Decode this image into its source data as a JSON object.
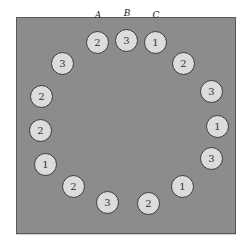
{
  "diagram": {
    "labels": [
      {
        "text": "A",
        "x": 98,
        "y": 19
      },
      {
        "text": "B",
        "x": 127,
        "y": 17
      },
      {
        "text": "C",
        "x": 156,
        "y": 19
      }
    ],
    "tokens": [
      {
        "value": "2",
        "x": 98,
        "y": 43
      },
      {
        "value": "3",
        "x": 127,
        "y": 41
      },
      {
        "value": "1",
        "x": 156,
        "y": 43
      },
      {
        "value": "2",
        "x": 184,
        "y": 64
      },
      {
        "value": "3",
        "x": 212,
        "y": 92
      },
      {
        "value": "1",
        "x": 218,
        "y": 127
      },
      {
        "value": "3",
        "x": 212,
        "y": 159
      },
      {
        "value": "1",
        "x": 183,
        "y": 187
      },
      {
        "value": "2",
        "x": 149,
        "y": 204
      },
      {
        "value": "3",
        "x": 108,
        "y": 203
      },
      {
        "value": "2",
        "x": 74,
        "y": 187
      },
      {
        "value": "1",
        "x": 46,
        "y": 165
      },
      {
        "value": "2",
        "x": 41,
        "y": 131
      },
      {
        "value": "2",
        "x": 42,
        "y": 97
      },
      {
        "value": "3",
        "x": 63,
        "y": 64
      }
    ]
  }
}
